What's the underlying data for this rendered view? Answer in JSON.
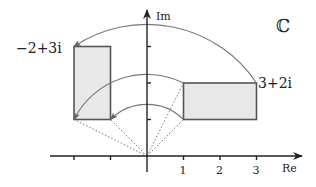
{
  "diagram": {
    "type": "complex-plane-rotation",
    "plane_symbol": "ℂ",
    "axes": {
      "real_label": "Re",
      "imag_label": "Im",
      "real_ticks": [
        -2,
        -1,
        1,
        2,
        3
      ],
      "real_tick_labels": [
        "1",
        "2",
        "3"
      ],
      "imag_ticks": [
        1,
        2,
        3
      ]
    },
    "points": {
      "source_corner": {
        "re": 3,
        "im": 2,
        "label": "3+2i"
      },
      "image_corner": {
        "re": -2,
        "im": 3,
        "label": "−2+3i"
      }
    },
    "source_rectangle": {
      "re_min": 1,
      "re_max": 3,
      "im_min": 1,
      "im_max": 2
    },
    "image_rectangle": {
      "re_min": -2,
      "re_max": -1,
      "im_min": 1,
      "im_max": 3
    },
    "rotation_arcs": [
      {
        "from": [
          3,
          2
        ],
        "to": [
          -2,
          3
        ]
      },
      {
        "from": [
          1,
          2
        ],
        "to": [
          -2,
          1
        ]
      },
      {
        "from": [
          1,
          1
        ],
        "to": [
          -1,
          1
        ]
      }
    ],
    "dotted_rays": [
      [
        1,
        1
      ],
      [
        1,
        2
      ],
      [
        -1,
        1
      ],
      [
        -2,
        1
      ]
    ],
    "colors": {
      "fill": "#e8e8e8",
      "stroke": "#555555",
      "axis": "#222222",
      "arc": "#777777"
    }
  }
}
